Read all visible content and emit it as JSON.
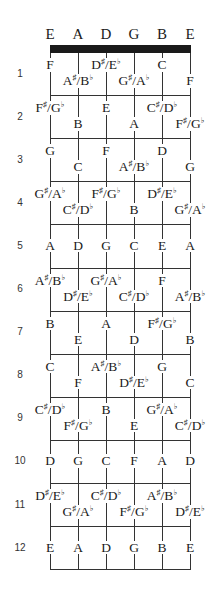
{
  "open_strings": [
    "E",
    "A",
    "D",
    "G",
    "B",
    "E"
  ],
  "frets": [
    {
      "number": "1",
      "notes": [
        "F",
        "A♯/B♭",
        "D♯/E♭",
        "G♯/A♭",
        "C",
        "F"
      ]
    },
    {
      "number": "2",
      "notes": [
        "F♯/G♭",
        "B",
        "E",
        "A",
        "C♯/D♭",
        "F♯/G♭"
      ]
    },
    {
      "number": "3",
      "notes": [
        "G",
        "C",
        "F",
        "A♯/B♭",
        "D",
        "G"
      ]
    },
    {
      "number": "4",
      "notes": [
        "G♯/A♭",
        "C♯/D♭",
        "F♯/G♭",
        "B",
        "D♯/E♭",
        "G♯/A♭"
      ]
    },
    {
      "number": "5",
      "notes": [
        "A",
        "D",
        "G",
        "C",
        "E",
        "A"
      ]
    },
    {
      "number": "6",
      "notes": [
        "A♯/B♭",
        "D♯/E♭",
        "G♯/A♭",
        "C♯/D♭",
        "F",
        "A♯/B♭"
      ]
    },
    {
      "number": "7",
      "notes": [
        "B",
        "E",
        "A",
        "D",
        "F♯/G♭",
        "B"
      ]
    },
    {
      "number": "8",
      "notes": [
        "C",
        "F",
        "A♯/B♭",
        "D♯/E♭",
        "G",
        "C"
      ]
    },
    {
      "number": "9",
      "notes": [
        "C♯/D♭",
        "F♯/G♭",
        "B",
        "E",
        "G♯/A♭",
        "C♯/D♭"
      ]
    },
    {
      "number": "10",
      "notes": [
        "D",
        "G",
        "C",
        "F",
        "A",
        "D"
      ]
    },
    {
      "number": "11",
      "notes": [
        "D♯/E♭",
        "G♯/A♭",
        "C♯/D♭",
        "F♯/G♭",
        "A♯/B♭",
        "D♯/E♭"
      ]
    },
    {
      "number": "12",
      "notes": [
        "E",
        "A",
        "D",
        "G",
        "B",
        "E"
      ]
    }
  ],
  "single_row_frets": [
    "5",
    "10",
    "12"
  ]
}
